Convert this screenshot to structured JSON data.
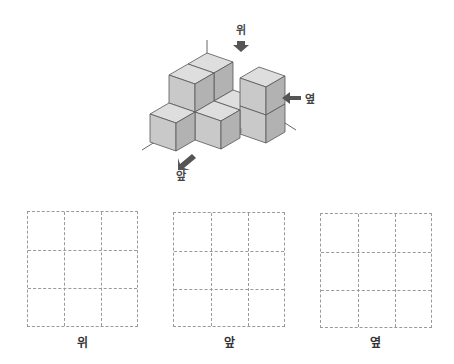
{
  "figure": {
    "colors": {
      "top_face": "#dedede",
      "front_face": "#c9c9c9",
      "side_face": "#b2b2b2",
      "edge": "#555555",
      "axis": "#666666",
      "arrow": "#555555"
    },
    "direction_labels": {
      "top": "위",
      "side": "옆",
      "front": "앞"
    }
  },
  "grids": [
    {
      "label": "위",
      "rows": 3,
      "cols": 3
    },
    {
      "label": "앞",
      "rows": 3,
      "cols": 3
    },
    {
      "label": "옆",
      "rows": 3,
      "cols": 3
    }
  ]
}
